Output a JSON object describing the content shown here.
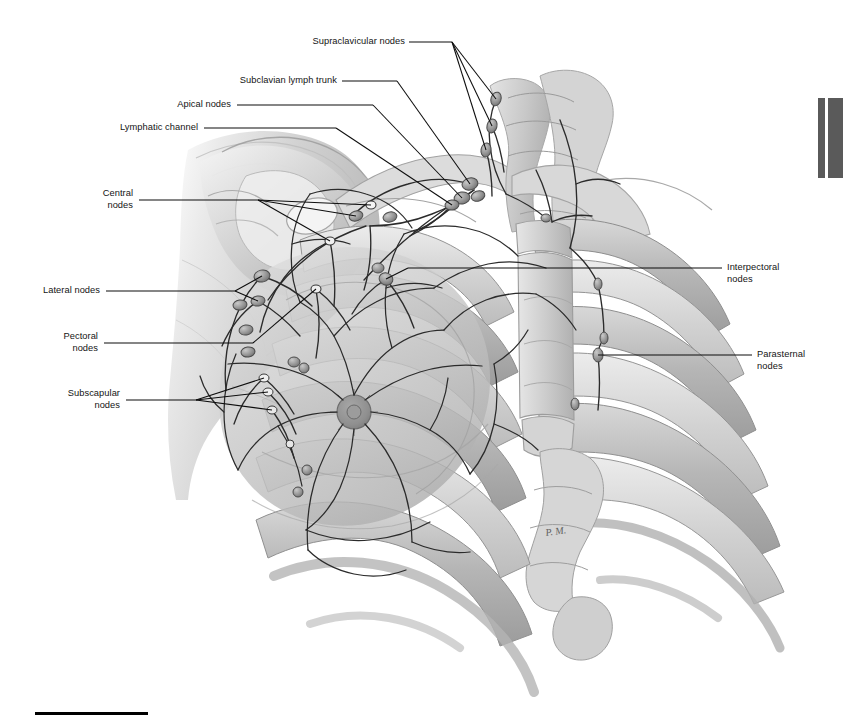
{
  "figure": {
    "signature": "P.M.",
    "background_color": "#ffffff",
    "ink_color": "#1a1a1a",
    "tone_light": "#e4e4e4",
    "tone_mid": "#c2c2c2",
    "tone_dark": "#9a9a9a",
    "node_color": "#8c8c8c"
  },
  "labels": [
    {
      "id": "supraclavicular-nodes",
      "text": "Supraclavicular nodes",
      "align": "right",
      "x": 285,
      "y": 36,
      "width": 120,
      "leader": {
        "x1": 409,
        "y1": 42,
        "x2": 452,
        "y2": 42
      },
      "branches": [
        {
          "x1": 452,
          "y1": 42,
          "x2": 496,
          "y2": 99
        },
        {
          "x1": 452,
          "y1": 42,
          "x2": 492,
          "y2": 126
        },
        {
          "x1": 452,
          "y1": 42,
          "x2": 486,
          "y2": 150
        }
      ]
    },
    {
      "id": "subclavian-lymph-trunk",
      "text": "Subclavian lymph trunk",
      "align": "right",
      "x": 233,
      "y": 75,
      "width": 104,
      "leader": {
        "x1": 342,
        "y1": 81,
        "x2": 397,
        "y2": 81
      },
      "branches": [
        {
          "x1": 397,
          "y1": 81,
          "x2": 470,
          "y2": 184
        }
      ]
    },
    {
      "id": "apical-nodes",
      "text": "Apical nodes",
      "align": "right",
      "x": 167,
      "y": 99,
      "width": 64,
      "leader": {
        "x1": 237,
        "y1": 105,
        "x2": 373,
        "y2": 105
      },
      "branches": [
        {
          "x1": 373,
          "y1": 105,
          "x2": 462,
          "y2": 198
        }
      ]
    },
    {
      "id": "lymphatic-channel",
      "text": "Lymphatic channel",
      "align": "right",
      "x": 108,
      "y": 122,
      "width": 90,
      "leader": {
        "x1": 204,
        "y1": 128,
        "x2": 336,
        "y2": 128
      },
      "branches": [
        {
          "x1": 336,
          "y1": 128,
          "x2": 452,
          "y2": 205
        }
      ]
    },
    {
      "id": "central-nodes",
      "text": "Central\nnodes",
      "align": "right",
      "x": 85,
      "y": 188,
      "width": 48,
      "leader": {
        "x1": 139,
        "y1": 200,
        "x2": 258,
        "y2": 200
      },
      "branches": [
        {
          "x1": 258,
          "y1": 200,
          "x2": 330,
          "y2": 241
        },
        {
          "x1": 258,
          "y1": 200,
          "x2": 356,
          "y2": 216
        },
        {
          "x1": 258,
          "y1": 200,
          "x2": 371,
          "y2": 205
        }
      ]
    },
    {
      "id": "lateral-nodes",
      "text": "Lateral nodes",
      "align": "right",
      "x": 33,
      "y": 285,
      "width": 67,
      "leader": {
        "x1": 106,
        "y1": 291,
        "x2": 235,
        "y2": 291
      },
      "branches": [
        {
          "x1": 235,
          "y1": 291,
          "x2": 262,
          "y2": 276
        },
        {
          "x1": 235,
          "y1": 291,
          "x2": 258,
          "y2": 301
        }
      ]
    },
    {
      "id": "pectoral-nodes",
      "text": "Pectoral\nnodes",
      "align": "right",
      "x": 50,
      "y": 331,
      "width": 48,
      "leader": {
        "x1": 104,
        "y1": 343,
        "x2": 253,
        "y2": 343
      },
      "branches": [
        {
          "x1": 253,
          "y1": 343,
          "x2": 316,
          "y2": 289
        }
      ]
    },
    {
      "id": "subscapular-nodes",
      "text": "Subscapular\nnodes",
      "align": "right",
      "x": 54,
      "y": 394,
      "width": 66,
      "leader": {
        "x1": 126,
        "y1": 400,
        "x2": 196,
        "y2": 400
      },
      "branches": [
        {
          "x1": 196,
          "y1": 400,
          "x2": 264,
          "y2": 378
        },
        {
          "x1": 196,
          "y1": 400,
          "x2": 268,
          "y2": 392
        },
        {
          "x1": 196,
          "y1": 400,
          "x2": 272,
          "y2": 410
        }
      ]
    },
    {
      "id": "interpectoral-nodes",
      "text": "Interpectoral\nnodes",
      "align": "left",
      "x": 727,
      "y": 262,
      "width": 80,
      "leader": {
        "x1": 722,
        "y1": 268,
        "x2": 594,
        "y2": 268
      },
      "branches": [
        {
          "x1": 594,
          "y1": 268,
          "x2": 408,
          "y2": 268
        },
        {
          "x1": 408,
          "y1": 268,
          "x2": 386,
          "y2": 279
        }
      ]
    },
    {
      "id": "parasternal-nodes",
      "text": "Parasternal\nnodes",
      "align": "left",
      "x": 757,
      "y": 349,
      "width": 72,
      "leader": {
        "x1": 752,
        "y1": 355,
        "x2": 598,
        "y2": 355
      },
      "branches": []
    }
  ],
  "tab_marks": [
    {
      "id": "page-tab-left",
      "x": 818,
      "y": 98,
      "width": 7,
      "height": 80,
      "color": "#5a5a5a"
    },
    {
      "id": "page-tab-right",
      "x": 828,
      "y": 98,
      "width": 15,
      "height": 80,
      "color": "#5a5a5a"
    }
  ],
  "bottom_rule": {
    "x": 35,
    "y": 712,
    "width": 113,
    "height": 3,
    "color": "#000000"
  }
}
